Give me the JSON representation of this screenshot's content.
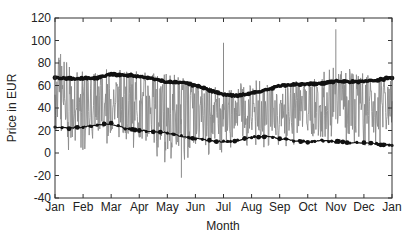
{
  "chart_data": {
    "type": "line",
    "title": "",
    "xlabel": "Month",
    "ylabel": "Price in EUR",
    "ylim": [
      -40,
      120
    ],
    "yticks": [
      -40,
      -20,
      0,
      20,
      40,
      60,
      80,
      100,
      120
    ],
    "xtick_labels": [
      "Jan",
      "Feb",
      "Mar",
      "Apr",
      "May",
      "Jun",
      "Jul",
      "Aug",
      "Sep",
      "Oct",
      "Nov",
      "Dec",
      "Jan"
    ],
    "grid": false,
    "legend": null,
    "series": [
      {
        "name": "Hourly spot price",
        "style": "gray-line",
        "color": "#8a8a8a",
        "note": "highly volatile hourly series oscillating roughly between 0 and 70 EUR, spikes up to ~110 (Nov) and dips to ~-20",
        "envelope_by_month": {
          "x": [
            0,
            1,
            2,
            3,
            4,
            5,
            6,
            7,
            8,
            9,
            10,
            11,
            12
          ],
          "high": [
            88,
            70,
            75,
            70,
            72,
            62,
            55,
            62,
            60,
            62,
            75,
            70,
            62
          ],
          "low": [
            5,
            0,
            5,
            0,
            -10,
            -5,
            0,
            5,
            5,
            5,
            5,
            5,
            10
          ]
        },
        "spikes": [
          {
            "x": 0.2,
            "y": 88
          },
          {
            "x": 6.0,
            "y": 98
          },
          {
            "x": 10.0,
            "y": 110
          },
          {
            "x": 4.5,
            "y": -22
          }
        ]
      },
      {
        "name": "Upper smoothed curve",
        "style": "black-thick-dotted-line",
        "color": "#111111",
        "x": [
          0,
          0.5,
          1,
          1.5,
          2,
          2.5,
          3,
          3.5,
          4,
          4.5,
          5,
          5.5,
          6,
          6.5,
          7,
          7.5,
          8,
          8.5,
          9,
          9.5,
          10,
          10.5,
          11,
          11.5,
          12
        ],
        "values": [
          67,
          66,
          66,
          67,
          70,
          69,
          68,
          66,
          63,
          63,
          60,
          56,
          52,
          51,
          53,
          56,
          60,
          61,
          61,
          62,
          64,
          63,
          64,
          65,
          67
        ]
      },
      {
        "name": "Lower smoothed curve",
        "style": "black-dotted-line",
        "color": "#111111",
        "x": [
          0,
          0.5,
          1,
          1.5,
          2,
          2.5,
          3,
          3.5,
          4,
          4.5,
          5,
          5.5,
          6,
          6.5,
          7,
          7.5,
          8,
          8.5,
          9,
          9.5,
          10,
          10.5,
          11,
          11.5,
          12
        ],
        "values": [
          23,
          22,
          23,
          25,
          26,
          22,
          20,
          19,
          18,
          15,
          13,
          11,
          10,
          11,
          14,
          15,
          13,
          11,
          10,
          11,
          10,
          9,
          9,
          8,
          7
        ]
      }
    ]
  }
}
